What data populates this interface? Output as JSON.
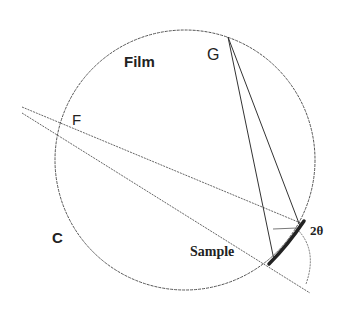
{
  "labels": {
    "film": "Film",
    "g": "G",
    "f": "F",
    "c": "C",
    "sample": "Sample",
    "angle": "2θ"
  },
  "colors": {
    "stroke": "#444444",
    "sample": "#222222",
    "text": "#222222"
  }
}
